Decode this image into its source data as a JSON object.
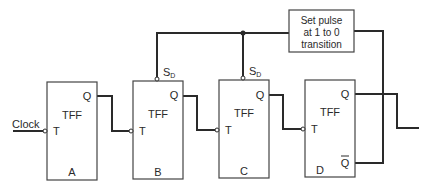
{
  "diagram": {
    "type": "ripple counter with set pulse",
    "input_label": "Clock",
    "set_pulse_box": {
      "lines": [
        "Set pulse",
        "at 1 to 0",
        "transition"
      ]
    },
    "flip_flops": [
      {
        "id": "A",
        "type": "TFF",
        "input": "T",
        "output": "Q",
        "preset": ""
      },
      {
        "id": "B",
        "type": "TFF",
        "input": "T",
        "output": "Q",
        "preset": "S",
        "preset_sub": "D"
      },
      {
        "id": "C",
        "type": "TFF",
        "input": "T",
        "output": "Q",
        "preset": "S",
        "preset_sub": "D"
      },
      {
        "id": "D",
        "type": "TFF",
        "input": "T",
        "output": "Q",
        "output_bar": "Q"
      }
    ]
  }
}
